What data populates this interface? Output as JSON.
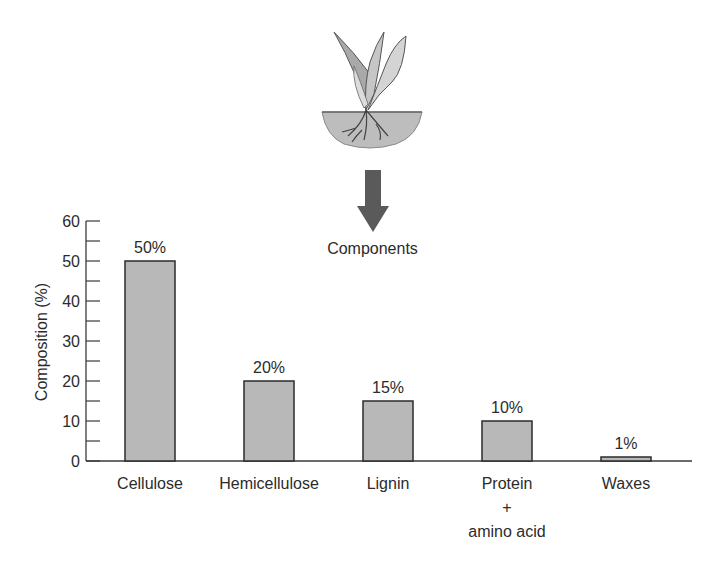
{
  "header": {
    "arrow_label": "Components",
    "plant_icon": "plant-with-roots-icon",
    "arrow_icon": "arrow-down-icon"
  },
  "colors": {
    "bar_fill": "#b8b8b8",
    "bar_stroke": "#2b2b2b",
    "axis": "#3a3a3a",
    "arrow": "#5a5a5a",
    "soil": "#bdbdbd"
  },
  "chart_data": {
    "type": "bar",
    "title": "Components",
    "xlabel": "",
    "ylabel": "Composition (%)",
    "ylim": [
      0,
      60
    ],
    "yticks": [
      0,
      10,
      20,
      30,
      40,
      50,
      60
    ],
    "minor_ytick_step": 5,
    "grid": false,
    "legend": null,
    "categories": [
      "Cellulose",
      "Hemicellulose",
      "Lignin",
      "Protein + amino acid",
      "Waxes"
    ],
    "category_label_lines": [
      [
        "Cellulose"
      ],
      [
        "Hemicellulose"
      ],
      [
        "Lignin"
      ],
      [
        "Protein",
        "+",
        "amino acid"
      ],
      [
        "Waxes"
      ]
    ],
    "values": [
      50,
      20,
      15,
      10,
      1
    ],
    "value_labels": [
      "50%",
      "20%",
      "15%",
      "10%",
      "1%"
    ]
  }
}
